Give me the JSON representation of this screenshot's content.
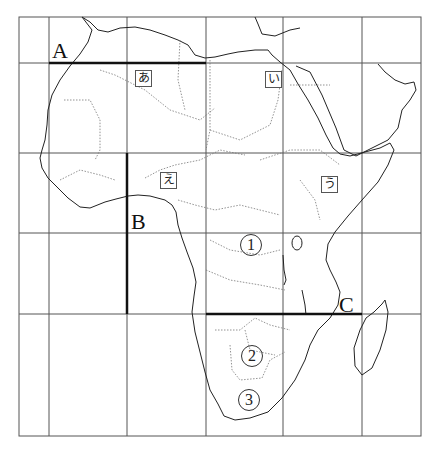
{
  "map": {
    "title": "Africa outline map with grid",
    "grid": {
      "x_lines": [
        19,
        49,
        127,
        206,
        283,
        362,
        421
      ],
      "y_lines": [
        17,
        63,
        153,
        233,
        314,
        436
      ]
    },
    "lines": [
      {
        "id": "A",
        "label": "A",
        "orientation": "horizontal",
        "from": [
          49,
          63
        ],
        "to": [
          206,
          63
        ]
      },
      {
        "id": "B",
        "label": "B",
        "orientation": "vertical",
        "from": [
          127,
          153
        ],
        "to": [
          127,
          314
        ]
      },
      {
        "id": "C",
        "label": "C",
        "orientation": "horizontal",
        "from": [
          206,
          314
        ],
        "to": [
          362,
          314
        ]
      }
    ],
    "line_labels": {
      "A": "A",
      "B": "B",
      "C": "C"
    },
    "region_labels": {
      "a": "あ",
      "i": "い",
      "u": "う",
      "e": "え"
    },
    "numbered_labels": {
      "n1": "①",
      "n2": "②",
      "n3": "③"
    },
    "colors": {
      "grid": "#555555",
      "coast": "#222222",
      "border": "#777777",
      "bold_line": "#111111"
    }
  }
}
